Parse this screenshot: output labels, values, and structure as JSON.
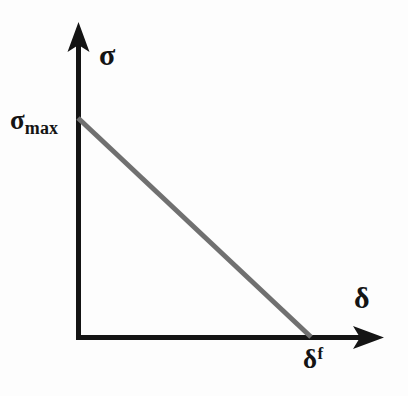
{
  "figure": {
    "kind": "line-diagram",
    "background_color": "#fdfdfd",
    "axis_color": "#141414",
    "curve_color": "#707070",
    "label_color": "#141414"
  },
  "axes": {
    "y_axis": {
      "name": "stress-axis",
      "label": "σ",
      "origin_x": 78,
      "origin_y": 337,
      "tip_y": 25,
      "thickness": 5,
      "arrow": "up-arrow"
    },
    "x_axis": {
      "name": "separation-axis",
      "label": "δ",
      "origin_x": 78,
      "origin_y": 337,
      "tip_x": 382,
      "thickness": 5,
      "arrow": "right-arrow"
    }
  },
  "labels": {
    "y_axis_label": "σ",
    "x_axis_label": "δ",
    "sigma_max_base": "σ",
    "sigma_max_sub": "max",
    "delta_f_base": "δ",
    "delta_f_sup": "f"
  },
  "chart_data": {
    "type": "line",
    "title": "",
    "xlabel": "δ",
    "ylabel": "σ",
    "xlim": [
      0,
      1.31
    ],
    "ylim": [
      0,
      1.42
    ],
    "grid": false,
    "legend": null,
    "series": [
      {
        "name": "linear softening law",
        "color": "#707070",
        "width": 5,
        "x": [
          0,
          1
        ],
        "y": [
          1,
          0
        ],
        "x_pixels": [
          78,
          310
        ],
        "y_pixels": [
          118,
          337
        ]
      }
    ],
    "annotations": [
      {
        "name": "sigma-max-tick-label",
        "text": "σmax",
        "axis": "y",
        "value": 1,
        "x_pixel": 10,
        "y_pixel": 118
      },
      {
        "name": "delta-f-tick-label",
        "text": "δf",
        "axis": "x",
        "value": 1,
        "x_pixel": 310,
        "y_pixel": 337
      }
    ]
  }
}
